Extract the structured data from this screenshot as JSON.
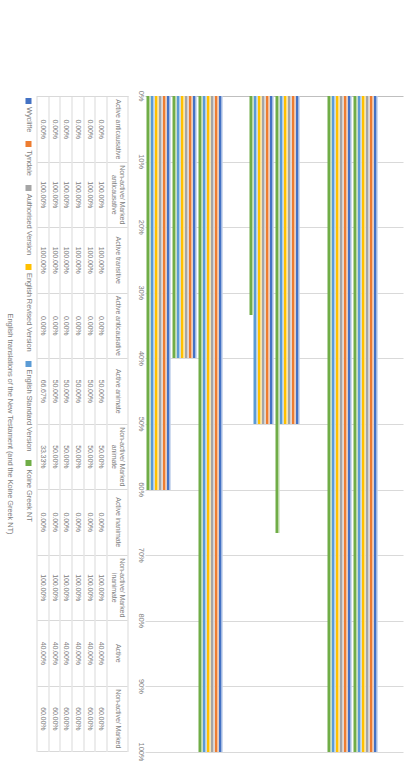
{
  "chart_data": {
    "type": "bar",
    "orientation": "vertical",
    "title": "",
    "xlabel": "English translations of the New Testament (and the Koine Greek NT)",
    "ylabel": "Voice, transitivity, animacy of the subject (Percentages)",
    "ylim": [
      0,
      100
    ],
    "grid": true,
    "legend_position": "bottom",
    "tick_labels": [
      "0%",
      "10%",
      "20%",
      "30%",
      "40%",
      "50%",
      "60%",
      "70%",
      "80%",
      "90%",
      "100%"
    ],
    "tick_values": [
      0,
      10,
      20,
      30,
      40,
      50,
      60,
      70,
      80,
      90,
      100
    ],
    "categories": [
      "Active anticausative",
      "Non-active/ Marked anticausative",
      "Active transitive",
      "Active anticausative",
      "Active animate",
      "Non-active/ Marked animate",
      "Active inanimate",
      "Non-active/ Marked inanimate",
      "Active",
      "Non-active/ Marked"
    ],
    "series": [
      {
        "name": "Wycliffe",
        "color": "#4472C4",
        "values": [
          0,
          100,
          100,
          0,
          50,
          50,
          0,
          100,
          40,
          60
        ],
        "labels": [
          "0.00%",
          "100.00%",
          "100.00%",
          "0.00%",
          "50.00%",
          "50.00%",
          "0.00%",
          "100.00%",
          "40.00%",
          "60.00%"
        ]
      },
      {
        "name": "Tyndale",
        "color": "#ED7D31",
        "values": [
          0,
          100,
          100,
          0,
          50,
          50,
          0,
          100,
          40,
          60
        ],
        "labels": [
          "0.00%",
          "100.00%",
          "100.00%",
          "0.00%",
          "50.00%",
          "50.00%",
          "0.00%",
          "100.00%",
          "40.00%",
          "60.00%"
        ]
      },
      {
        "name": "Authorised Version",
        "color": "#A5A5A5",
        "values": [
          0,
          100,
          100,
          0,
          50,
          50,
          0,
          100,
          40,
          60
        ],
        "labels": [
          "0.00%",
          "100.00%",
          "100.00%",
          "0.00%",
          "50.00%",
          "50.00%",
          "0.00%",
          "100.00%",
          "40.00%",
          "60.00%"
        ]
      },
      {
        "name": "English Revised Version",
        "color": "#FFC000",
        "values": [
          0,
          100,
          100,
          0,
          50,
          50,
          0,
          100,
          40,
          60
        ],
        "labels": [
          "0.00%",
          "100.00%",
          "100.00%",
          "0.00%",
          "50.00%",
          "50.00%",
          "0.00%",
          "100.00%",
          "40.00%",
          "60.00%"
        ]
      },
      {
        "name": "English Standard Version",
        "color": "#5B9BD5",
        "values": [
          0,
          100,
          100,
          0,
          50,
          50,
          0,
          100,
          40,
          60
        ],
        "labels": [
          "0.00%",
          "100.00%",
          "100.00%",
          "0.00%",
          "50.00%",
          "50.00%",
          "0.00%",
          "100.00%",
          "40.00%",
          "60.00%"
        ]
      },
      {
        "name": "Koine Greek NT",
        "color": "#70AD47",
        "values": [
          0,
          100,
          100,
          0,
          66.67,
          33.33,
          0,
          100,
          40,
          60
        ],
        "labels": [
          "0.00%",
          "100.00%",
          "100.00%",
          "0.00%",
          "66.67%",
          "33.33%",
          "0.00%",
          "100.00%",
          "40.00%",
          "60.00%"
        ]
      }
    ],
    "data_table": {
      "row_headers": [
        "Wycliffe",
        "Tyndale",
        "Authorised Version",
        "English Revised Version",
        "English Standard Version",
        "Koine Greek NT"
      ],
      "columns": [
        {
          "header": "Active anticausative",
          "cells": [
            "0.00%",
            "0.00%",
            "0.00%",
            "0.00%",
            "0.00%",
            "0.00%"
          ]
        },
        {
          "header": "Non-active/ Marked anticausative",
          "cells": [
            "100.00%",
            "100.00%",
            "100.00%",
            "100.00%",
            "100.00%",
            "100.00%"
          ]
        },
        {
          "header": "Active transitive",
          "cells": [
            "100.00%",
            "100.00%",
            "100.00%",
            "100.00%",
            "100.00%",
            "100.00%"
          ]
        },
        {
          "header": "Active anticausative",
          "cells": [
            "0.00%",
            "0.00%",
            "0.00%",
            "0.00%",
            "0.00%",
            "0.00%"
          ]
        },
        {
          "header": "Active animate",
          "cells": [
            "50.00%",
            "50.00%",
            "50.00%",
            "50.00%",
            "50.00%",
            "66.67%"
          ]
        },
        {
          "header": "Non-active/ Marked animate",
          "cells": [
            "50.00%",
            "50.00%",
            "50.00%",
            "50.00%",
            "50.00%",
            "33.33%"
          ]
        },
        {
          "header": "Active inanimate",
          "cells": [
            "0.00%",
            "0.00%",
            "0.00%",
            "0.00%",
            "0.00%",
            "0.00%"
          ]
        },
        {
          "header": "Non-active/ Marked inanimate",
          "cells": [
            "100.00%",
            "100.00%",
            "100.00%",
            "100.00%",
            "100.00%",
            "100.00%"
          ]
        },
        {
          "header": "Active",
          "cells": [
            "40.00%",
            "40.00%",
            "40.00%",
            "40.00%",
            "40.00%",
            "40.00%"
          ]
        },
        {
          "header": "Non-active/ Marked",
          "cells": [
            "60.00%",
            "60.00%",
            "60.00%",
            "60.00%",
            "60.00%",
            "60.00%"
          ]
        }
      ]
    }
  }
}
